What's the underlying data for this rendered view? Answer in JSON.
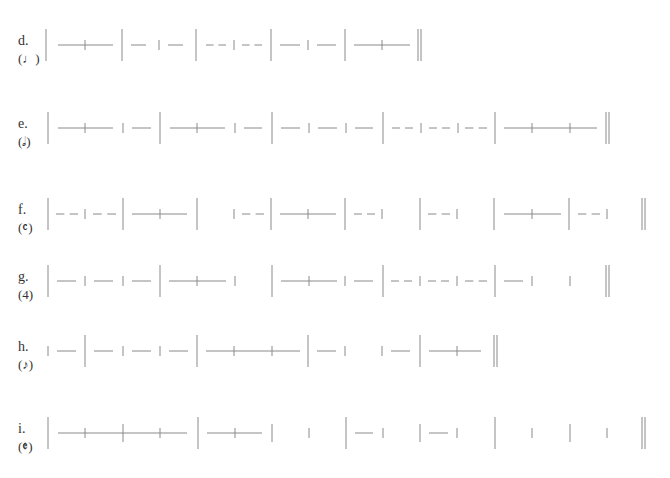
{
  "page": {
    "line_color": "#8a8a8a",
    "text_color": "#333333"
  },
  "exercises": [
    {
      "letter": "d.",
      "unit": "(♩)",
      "unit_glyph": "quarter-note",
      "y": 17,
      "tokens": [
        {
          "t": "bar",
          "x": 46
        },
        {
          "t": "tie",
          "x1": 58,
          "x2": 113,
          "ticks": [
            85
          ]
        },
        {
          "t": "bar",
          "x": 122
        },
        {
          "t": "dash",
          "x1": 131,
          "x2": 146
        },
        {
          "t": "tick",
          "x": 159
        },
        {
          "t": "dash",
          "x1": 168,
          "x2": 183
        },
        {
          "t": "bar",
          "x": 196
        },
        {
          "t": "dashes",
          "x1": 206,
          "x2": 226
        },
        {
          "t": "tick",
          "x": 234
        },
        {
          "t": "dashes",
          "x1": 242,
          "x2": 262
        },
        {
          "t": "bar",
          "x": 271
        },
        {
          "t": "dash",
          "x1": 280,
          "x2": 300
        },
        {
          "t": "tick",
          "x": 308
        },
        {
          "t": "dash",
          "x1": 317,
          "x2": 336
        },
        {
          "t": "bar",
          "x": 345
        },
        {
          "t": "tie",
          "x1": 354,
          "x2": 410,
          "ticks": [
            382
          ]
        },
        {
          "t": "final",
          "x": 420
        }
      ]
    },
    {
      "letter": "e.",
      "unit": "(𝅗𝅥)",
      "unit_glyph": "half-note",
      "y": 100,
      "tokens": [
        {
          "t": "bar",
          "x": 48
        },
        {
          "t": "tie",
          "x1": 58,
          "x2": 113,
          "ticks": [
            85
          ]
        },
        {
          "t": "tick",
          "x": 123
        },
        {
          "t": "dash",
          "x1": 132,
          "x2": 151
        },
        {
          "t": "bar",
          "x": 160
        },
        {
          "t": "tie",
          "x1": 170,
          "x2": 225,
          "ticks": [
            197
          ]
        },
        {
          "t": "tick",
          "x": 235
        },
        {
          "t": "dash",
          "x1": 244,
          "x2": 262
        },
        {
          "t": "bar",
          "x": 272
        },
        {
          "t": "dash",
          "x1": 281,
          "x2": 300
        },
        {
          "t": "tick",
          "x": 309
        },
        {
          "t": "dash",
          "x1": 318,
          "x2": 337
        },
        {
          "t": "tick",
          "x": 346
        },
        {
          "t": "dash",
          "x1": 355,
          "x2": 373
        },
        {
          "t": "bar",
          "x": 383
        },
        {
          "t": "dashes",
          "x1": 392,
          "x2": 413
        },
        {
          "t": "tick",
          "x": 421
        },
        {
          "t": "dashes",
          "x1": 429,
          "x2": 450
        },
        {
          "t": "tick",
          "x": 458
        },
        {
          "t": "dashes",
          "x1": 465,
          "x2": 487
        },
        {
          "t": "bar",
          "x": 495
        },
        {
          "t": "tie",
          "x1": 504,
          "x2": 597,
          "ticks": [
            532,
            570
          ]
        },
        {
          "t": "final",
          "x": 608
        }
      ]
    },
    {
      "letter": "f.",
      "unit": "(𝄴)",
      "unit_glyph": "common-time",
      "y": 186,
      "tokens": [
        {
          "t": "bar",
          "x": 48
        },
        {
          "t": "dashes",
          "x1": 56,
          "x2": 78
        },
        {
          "t": "tick",
          "x": 85
        },
        {
          "t": "dashes",
          "x1": 93,
          "x2": 116
        },
        {
          "t": "bar",
          "x": 123
        },
        {
          "t": "tie",
          "x1": 132,
          "x2": 187,
          "ticks": [
            160
          ]
        },
        {
          "t": "bar",
          "x": 197
        },
        {
          "t": "tick",
          "x": 234
        },
        {
          "t": "dashes",
          "x1": 242,
          "x2": 264
        },
        {
          "t": "bar",
          "x": 271
        },
        {
          "t": "tie",
          "x1": 280,
          "x2": 336,
          "ticks": [
            308
          ]
        },
        {
          "t": "bar",
          "x": 345
        },
        {
          "t": "dashes",
          "x1": 354,
          "x2": 375
        },
        {
          "t": "tick",
          "x": 382
        },
        {
          "t": "bar",
          "x": 420
        },
        {
          "t": "dashes",
          "x1": 428,
          "x2": 450
        },
        {
          "t": "tick",
          "x": 457
        },
        {
          "t": "bar",
          "x": 494
        },
        {
          "t": "tie",
          "x1": 504,
          "x2": 561,
          "ticks": [
            532
          ]
        },
        {
          "t": "bar",
          "x": 569
        },
        {
          "t": "dashes",
          "x1": 578,
          "x2": 600
        },
        {
          "t": "tick",
          "x": 607
        },
        {
          "t": "final",
          "x": 644
        }
      ]
    },
    {
      "letter": "g.",
      "unit": "(4)",
      "unit_glyph": "numeral-4",
      "y": 253,
      "tokens": [
        {
          "t": "bar",
          "x": 48
        },
        {
          "t": "dash",
          "x1": 57,
          "x2": 76
        },
        {
          "t": "tick",
          "x": 85
        },
        {
          "t": "dash",
          "x1": 94,
          "x2": 113
        },
        {
          "t": "tick",
          "x": 123
        },
        {
          "t": "dash",
          "x1": 132,
          "x2": 151
        },
        {
          "t": "bar",
          "x": 160
        },
        {
          "t": "tie",
          "x1": 169,
          "x2": 226,
          "ticks": [
            197
          ]
        },
        {
          "t": "tick",
          "x": 235
        },
        {
          "t": "bar",
          "x": 272
        },
        {
          "t": "tie",
          "x1": 281,
          "x2": 337,
          "ticks": [
            309
          ]
        },
        {
          "t": "tick",
          "x": 345
        },
        {
          "t": "dash",
          "x1": 354,
          "x2": 373
        },
        {
          "t": "bar",
          "x": 383
        },
        {
          "t": "dashes",
          "x1": 391,
          "x2": 412
        },
        {
          "t": "tick",
          "x": 420
        },
        {
          "t": "dashes",
          "x1": 428,
          "x2": 449
        },
        {
          "t": "tick",
          "x": 457
        },
        {
          "t": "dashes",
          "x1": 465,
          "x2": 487
        },
        {
          "t": "bar",
          "x": 495
        },
        {
          "t": "dash",
          "x1": 504,
          "x2": 523
        },
        {
          "t": "tick",
          "x": 532
        },
        {
          "t": "tick",
          "x": 570
        },
        {
          "t": "final",
          "x": 608
        }
      ]
    },
    {
      "letter": "h.",
      "unit": "(♪)",
      "unit_glyph": "eighth-note",
      "y": 323,
      "tokens": [
        {
          "t": "tick",
          "x": 48
        },
        {
          "t": "dash",
          "x1": 57,
          "x2": 76
        },
        {
          "t": "bar",
          "x": 85
        },
        {
          "t": "dash",
          "x1": 94,
          "x2": 113
        },
        {
          "t": "tick",
          "x": 123
        },
        {
          "t": "dash",
          "x1": 132,
          "x2": 151
        },
        {
          "t": "tick",
          "x": 160
        },
        {
          "t": "dash",
          "x1": 169,
          "x2": 188
        },
        {
          "t": "bar",
          "x": 197
        },
        {
          "t": "tie",
          "x1": 206,
          "x2": 300,
          "ticks": [
            234,
            272
          ]
        },
        {
          "t": "bar",
          "x": 308
        },
        {
          "t": "dash",
          "x1": 317,
          "x2": 336
        },
        {
          "t": "tick",
          "x": 345
        },
        {
          "t": "tick",
          "x": 382
        },
        {
          "t": "dash",
          "x1": 391,
          "x2": 410
        },
        {
          "t": "bar",
          "x": 420
        },
        {
          "t": "tie",
          "x1": 429,
          "x2": 481,
          "ticks": [
            457
          ]
        },
        {
          "t": "final",
          "x": 496
        }
      ]
    },
    {
      "letter": "i.",
      "unit": "(𝄵)",
      "unit_glyph": "cut-time",
      "y": 405,
      "tokens": [
        {
          "t": "bar",
          "x": 48
        },
        {
          "t": "tie",
          "x1": 58,
          "x2": 187,
          "ticks": [
            85,
            160
          ]
        },
        {
          "t": "mid",
          "x": 123
        },
        {
          "t": "bar",
          "x": 198
        },
        {
          "t": "tie",
          "x1": 207,
          "x2": 262,
          "ticks": [
            235
          ]
        },
        {
          "t": "mid",
          "x": 272
        },
        {
          "t": "tick",
          "x": 309
        },
        {
          "t": "bar",
          "x": 346
        },
        {
          "t": "dash",
          "x1": 355,
          "x2": 373
        },
        {
          "t": "tick",
          "x": 383
        },
        {
          "t": "mid",
          "x": 420
        },
        {
          "t": "dash",
          "x1": 429,
          "x2": 448
        },
        {
          "t": "tick",
          "x": 457
        },
        {
          "t": "bar",
          "x": 495
        },
        {
          "t": "tick",
          "x": 532
        },
        {
          "t": "mid",
          "x": 570
        },
        {
          "t": "tick",
          "x": 607
        },
        {
          "t": "final",
          "x": 644
        }
      ]
    }
  ]
}
